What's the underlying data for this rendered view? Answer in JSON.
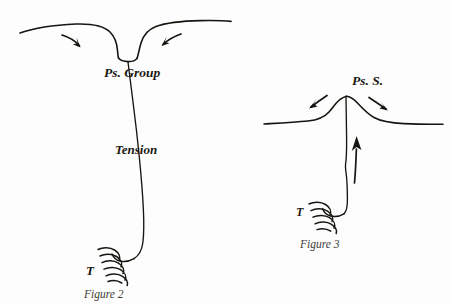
{
  "page": {
    "background_color": "#fdfdfd",
    "ink_color": "#17150f",
    "caption_color": "#3c3a35",
    "width": 452,
    "height": 304
  },
  "figure2": {
    "caption": "Figure 2",
    "labels": {
      "group": "Ps. Group",
      "tension": "Tension",
      "weight": "T"
    },
    "annotations": {
      "left_arrow": "curved-arrow-pointing-right-inward",
      "right_arrow": "curved-arrow-pointing-left-inward",
      "coil": "helical-spring-weight-symbol",
      "surface": "surface-line-with-central-depression",
      "tension_line": "vertical-tension-line"
    }
  },
  "figure3": {
    "caption": "Figure 3",
    "labels": {
      "group": "Ps. S.",
      "weight": "T"
    },
    "annotations": {
      "left_arrow": "arrow-pointing-down-left-outward",
      "right_arrow": "arrow-pointing-down-right-outward",
      "up_arrow": "straight-arrow-pointing-up",
      "coil": "helical-spring-weight-symbol",
      "surface": "surface-line-with-central-hump",
      "tension_line": "vertical-tension-line"
    }
  }
}
